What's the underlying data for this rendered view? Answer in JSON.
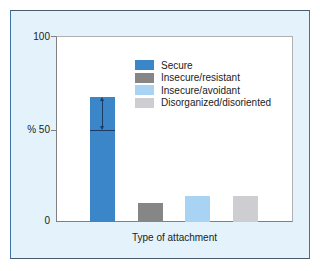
{
  "chart_data": {
    "type": "bar",
    "title": "",
    "xlabel": "Type of attachment",
    "ylabel": "%",
    "ylim": [
      0,
      100
    ],
    "yticks": [
      0,
      50,
      100
    ],
    "ytick_labels": [
      "0",
      "% 50",
      "100"
    ],
    "grid": false,
    "legend_position": "upper right",
    "categories": [
      "Secure",
      "Insecure/resistant",
      "Insecure/avoidant",
      "Disorganized/disoriented"
    ],
    "values": [
      67,
      10,
      14,
      14
    ],
    "colors": [
      "#3a86c8",
      "#868686",
      "#a9d3f2",
      "#cdcdd2"
    ],
    "annotations": [
      {
        "type": "double-arrow",
        "category": "Secure",
        "from": 50,
        "to": 67,
        "note": "range marker inside Secure bar from 50% line to bar top"
      }
    ]
  },
  "legend": {
    "items": [
      {
        "label": "Secure",
        "color": "#3a86c8"
      },
      {
        "label": "Insecure/resistant",
        "color": "#868686"
      },
      {
        "label": "Insecure/avoidant",
        "color": "#a9d3f2"
      },
      {
        "label": "Disorganized/disoriented",
        "color": "#cdcdd2"
      }
    ]
  },
  "axis": {
    "y_top": "100",
    "y_mid": "% 50",
    "y_bottom": "0",
    "x_label": "Type of attachment"
  }
}
